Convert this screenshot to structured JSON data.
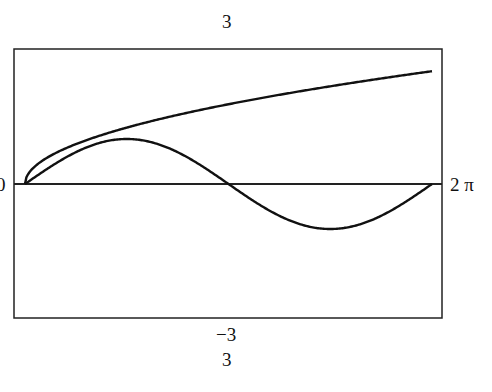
{
  "chart_data": {
    "type": "line",
    "title": "",
    "xlabel": "",
    "ylabel": "",
    "xlim": [
      0,
      6.2832
    ],
    "ylim": [
      -3,
      3
    ],
    "x_tick_labels": {
      "left": "0",
      "right": "2 π"
    },
    "y_tick_labels": {
      "top": "3",
      "bottom": "−3"
    },
    "extra_labels": [
      "3"
    ],
    "grid": false,
    "legend": null,
    "series": [
      {
        "name": "sqrt(x)",
        "x": [
          0,
          0.785,
          1.571,
          2.356,
          3.142,
          3.927,
          4.712,
          5.498,
          6.283
        ],
        "values": [
          0,
          0.886,
          1.253,
          1.535,
          1.772,
          1.982,
          2.171,
          2.345,
          2.507
        ]
      },
      {
        "name": "sin(x)",
        "x": [
          0,
          0.785,
          1.571,
          2.356,
          3.142,
          3.927,
          4.712,
          5.498,
          6.283
        ],
        "values": [
          0,
          0.707,
          1.0,
          0.707,
          0,
          -0.707,
          -1.0,
          -0.707,
          0
        ]
      }
    ]
  },
  "labels": {
    "top": "3",
    "bottom_min": "−3",
    "bottom_extra": "3",
    "x_start": "0",
    "x_end": "2 π"
  }
}
